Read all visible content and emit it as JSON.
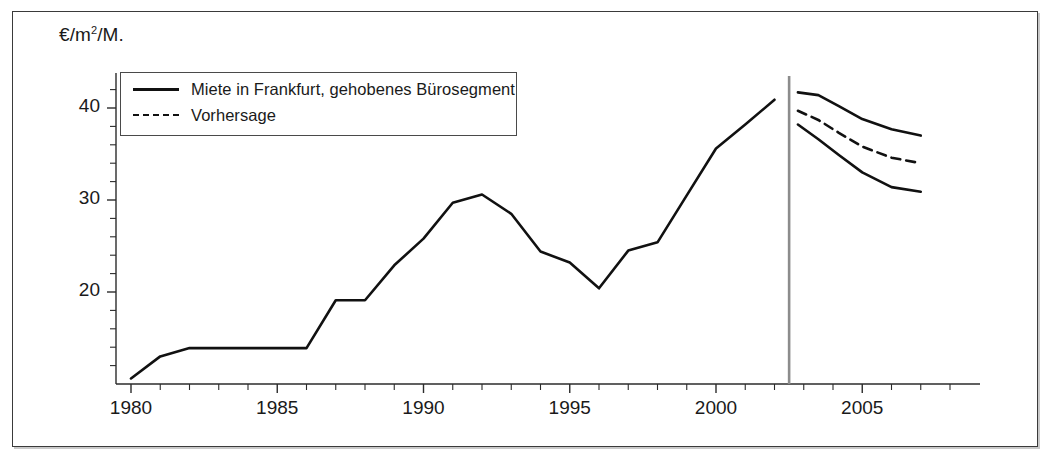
{
  "figure": {
    "background_color": "#ffffff",
    "frame_color": "#3a3a3a",
    "line_color": "#111111",
    "divider_color": "#8c8c8c"
  },
  "axes": {
    "y_unit_label_prefix": "€/m",
    "y_unit_label_sup": "2",
    "y_unit_label_suffix": "/M.",
    "y_ticks_major": [
      20,
      30,
      40
    ],
    "y_tick_labels": [
      "20",
      "30",
      "40"
    ],
    "y_minor_tick_step": 2,
    "y_min": 10,
    "y_max": 43.8,
    "x_ticks_major": [
      1980,
      1985,
      1990,
      1995,
      2000,
      2005
    ],
    "x_tick_labels": [
      "1980",
      "1985",
      "1990",
      "1995",
      "2000",
      "2005"
    ],
    "x_minor_tick_step": 1,
    "x_min": 1979.5,
    "x_max": 2008.5,
    "grid": false
  },
  "legend": {
    "position": "top-left",
    "entries": [
      {
        "label": "Miete in Frankfurt, gehobenes Bürosegment",
        "style": "solid"
      },
      {
        "label": "Vorhersage",
        "style": "dashed"
      }
    ]
  },
  "chart_data": {
    "type": "line",
    "title": "",
    "subtitle": "",
    "xlabel": "",
    "ylabel": "€/m2/M.",
    "xlim": [
      1979.5,
      2008.5
    ],
    "ylim": [
      10,
      43.8
    ],
    "grid": false,
    "legend_position": "top-left",
    "forecast_divider_x": 2002.5,
    "series": [
      {
        "name": "Miete in Frankfurt, gehobenes Bürosegment",
        "style": "solid",
        "x": [
          1980,
          1981,
          1982,
          1983,
          1984,
          1985,
          1986,
          1987,
          1988,
          1989,
          1990,
          1991,
          1992,
          1993,
          1994,
          1995,
          1996,
          1997,
          1998,
          1999,
          2000,
          2001,
          2002
        ],
        "values": [
          10.6,
          13.0,
          13.9,
          13.9,
          13.9,
          13.9,
          13.9,
          19.1,
          19.1,
          22.9,
          25.8,
          29.7,
          30.6,
          28.5,
          24.4,
          23.2,
          20.4,
          24.5,
          25.4,
          30.5,
          35.6,
          38.2,
          40.9
        ]
      },
      {
        "name": "Vorhersage Obergrenze",
        "style": "solid",
        "x": [
          2002.8,
          2003.5,
          2004.2,
          2005.0,
          2006.0,
          2007.0
        ],
        "values": [
          41.7,
          41.4,
          40.2,
          38.8,
          37.7,
          37.0
        ]
      },
      {
        "name": "Vorhersage",
        "style": "dashed",
        "x": [
          2002.8,
          2003.5,
          2004.2,
          2005.0,
          2006.0,
          2007.0
        ],
        "values": [
          39.7,
          38.7,
          37.3,
          35.8,
          34.6,
          34.0
        ]
      },
      {
        "name": "Vorhersage Untergrenze",
        "style": "solid",
        "x": [
          2002.8,
          2003.5,
          2004.2,
          2005.0,
          2006.0,
          2007.0
        ],
        "values": [
          38.2,
          36.6,
          34.9,
          33.0,
          31.4,
          30.9
        ]
      }
    ]
  }
}
